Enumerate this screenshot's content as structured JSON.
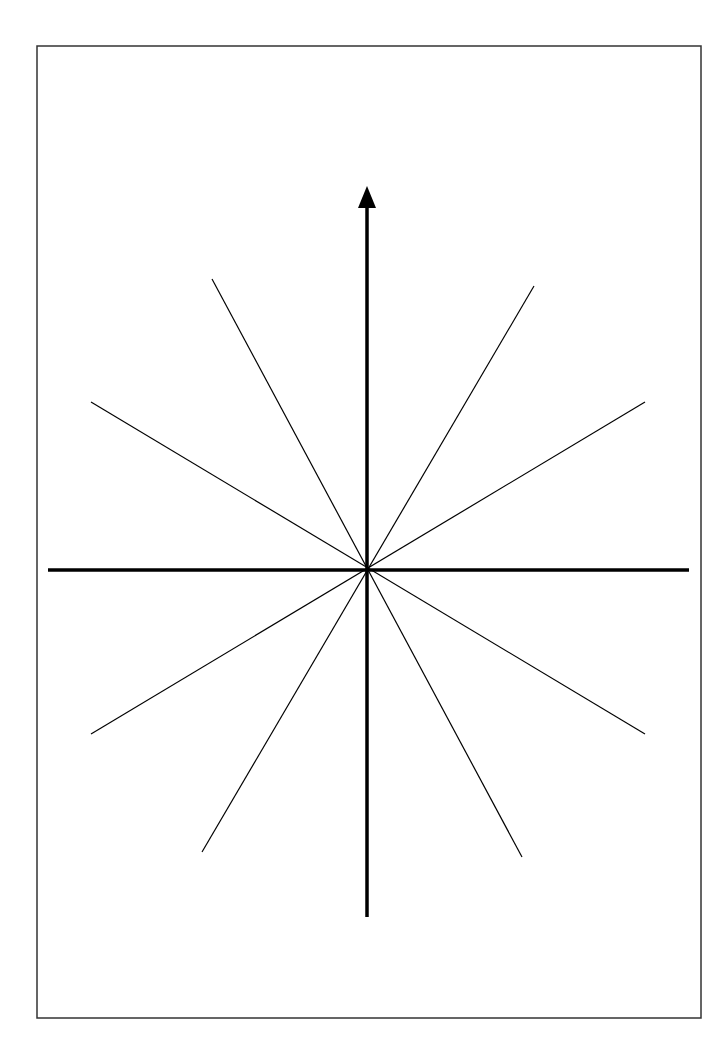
{
  "diagram": {
    "type": "radial-lines",
    "colors": {
      "stroke": "#000000",
      "frame": "#333333",
      "background": "#ffffff"
    },
    "frame": {
      "x": 37,
      "y": 46,
      "width": 664,
      "height": 972
    },
    "center": {
      "x": 367,
      "y": 570
    },
    "horizontal_axis": {
      "x1": 48,
      "x2": 689,
      "y": 570
    },
    "vertical_axis": {
      "x": 367,
      "y_top": 186,
      "y_bottom": 917,
      "arrow": "up"
    },
    "radial_lines": [
      {
        "x1": 212,
        "y1": 279,
        "x2": 522,
        "y2": 857
      },
      {
        "x1": 534,
        "y1": 286,
        "x2": 202,
        "y2": 852
      },
      {
        "x1": 91,
        "y1": 402,
        "x2": 645,
        "y2": 734
      },
      {
        "x1": 645,
        "y1": 402,
        "x2": 91,
        "y2": 734
      }
    ]
  }
}
